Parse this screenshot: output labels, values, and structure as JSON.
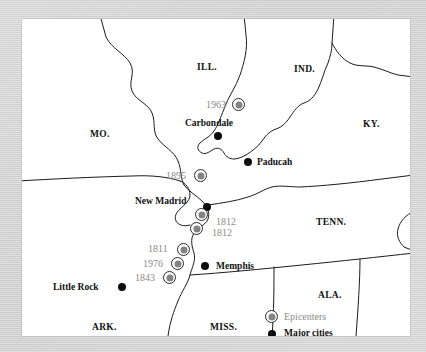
{
  "map": {
    "title": "New Madrid Seismic Zone earthquake epicenters map",
    "background_color": "#d2d2d2",
    "panel_color": "#ffffff",
    "epicenter_color": "#838383",
    "city_color": "#0b0b0b",
    "year_label_color": "#8a8a8a",
    "states": [
      {
        "name": "ILL.",
        "x": 175,
        "y": 44
      },
      {
        "name": "IND.",
        "x": 272,
        "y": 46
      },
      {
        "name": "KY.",
        "x": 341,
        "y": 101
      },
      {
        "name": "MO.",
        "x": 68,
        "y": 111
      },
      {
        "name": "TENN.",
        "x": 294,
        "y": 199
      },
      {
        "name": "ARK.",
        "x": 70,
        "y": 304
      },
      {
        "name": "MISS.",
        "x": 188,
        "y": 304
      },
      {
        "name": "ALA.",
        "x": 296,
        "y": 272
      }
    ],
    "cities": [
      {
        "name": "Carbondale",
        "label_x": 163,
        "label_y": 100,
        "dot_x": 192,
        "dot_y": 113
      },
      {
        "name": "Paducah",
        "label_x": 235,
        "label_y": 139,
        "dot_x": 222,
        "dot_y": 139
      },
      {
        "name": "New Madrid",
        "label_x": 113,
        "label_y": 178,
        "dot_x": 181,
        "dot_y": 184
      },
      {
        "name": "Memphis",
        "label_x": 194,
        "label_y": 243,
        "dot_x": 179,
        "dot_y": 243
      },
      {
        "name": "Little Rock",
        "label_x": 31,
        "label_y": 264,
        "dot_x": 96,
        "dot_y": 264
      }
    ],
    "epicenters": [
      {
        "year": "1963",
        "marker_x": 210,
        "marker_y": 79,
        "label_x": 184,
        "label_y": 81,
        "label_side": "left"
      },
      {
        "year": "1895",
        "marker_x": 172,
        "marker_y": 150,
        "label_x": 144,
        "label_y": 152,
        "label_side": "left"
      },
      {
        "year": "1812",
        "marker_x": 173,
        "marker_y": 189,
        "label_x": 194,
        "label_y": 198,
        "label_side": "right"
      },
      {
        "year": "1812",
        "marker_x": 168,
        "marker_y": 203,
        "label_x": 190,
        "label_y": 209,
        "label_side": "right"
      },
      {
        "year": "1811",
        "marker_x": 155,
        "marker_y": 224,
        "label_x": 126,
        "label_y": 225,
        "label_side": "left"
      },
      {
        "year": "1976",
        "marker_x": 149,
        "marker_y": 238,
        "label_x": 121,
        "label_y": 240,
        "label_side": "left"
      },
      {
        "year": "1843",
        "marker_x": 141,
        "marker_y": 252,
        "label_x": 113,
        "label_y": 254,
        "label_side": "left"
      }
    ],
    "legend": {
      "epicenters_label": "Epicenters",
      "cities_label": "Major cities"
    }
  }
}
